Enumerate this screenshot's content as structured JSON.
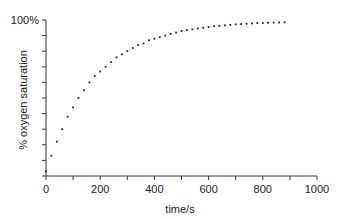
{
  "chart_data": {
    "type": "scatter",
    "title": "",
    "xlabel": "time/s",
    "ylabel": "% oxygen saturation",
    "xlim": [
      0,
      1000
    ],
    "ylim": [
      0,
      100
    ],
    "x_major_ticks": [
      0,
      200,
      400,
      600,
      800,
      1000
    ],
    "x_tick_labels": [
      "0",
      "200",
      "400",
      "600",
      "800",
      "1000"
    ],
    "x_minor_tick_step": 100,
    "y_tick_step": 10,
    "y_tick_labels": [
      {
        "value": 100,
        "label": "100%"
      }
    ],
    "grid": false,
    "legend": null,
    "marker": "dot",
    "color": "#222222",
    "series": [
      {
        "name": "oxygen saturation",
        "x": [
          0,
          20,
          40,
          60,
          80,
          100,
          120,
          140,
          160,
          180,
          200,
          220,
          240,
          260,
          280,
          300,
          320,
          340,
          360,
          380,
          400,
          420,
          440,
          460,
          480,
          500,
          520,
          540,
          560,
          580,
          600,
          620,
          640,
          660,
          680,
          700,
          720,
          740,
          760,
          780,
          800,
          820,
          840,
          860,
          880
        ],
        "y": [
          3,
          13,
          22,
          30,
          38,
          44,
          50,
          55,
          60,
          64,
          67,
          70,
          73,
          76,
          78,
          80,
          82,
          84,
          85,
          87,
          88,
          89,
          90,
          91,
          92,
          93,
          93.5,
          94,
          94.5,
          95,
          95.5,
          96,
          96.3,
          96.6,
          96.9,
          97.2,
          97.4,
          97.6,
          97.8,
          98,
          98.1,
          98.2,
          98.3,
          98.4,
          98.5
        ]
      }
    ]
  }
}
